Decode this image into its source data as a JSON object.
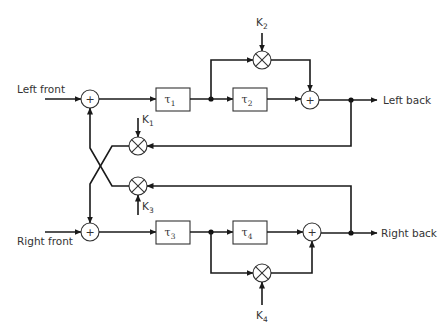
{
  "diagram": {
    "inputs": {
      "left_front": "Left front",
      "right_front": "Right front"
    },
    "outputs": {
      "left_back": "Left back",
      "right_back": "Right back"
    },
    "delays": [
      {
        "id": "tau1",
        "symbol": "τ",
        "sub": "1"
      },
      {
        "id": "tau2",
        "symbol": "τ",
        "sub": "2"
      },
      {
        "id": "tau3",
        "symbol": "τ",
        "sub": "3"
      },
      {
        "id": "tau4",
        "symbol": "τ",
        "sub": "4"
      }
    ],
    "gains": [
      {
        "id": "K1",
        "symbol": "K",
        "sub": "1"
      },
      {
        "id": "K2",
        "symbol": "K",
        "sub": "2"
      },
      {
        "id": "K3",
        "symbol": "K",
        "sub": "3"
      },
      {
        "id": "K4",
        "symbol": "K",
        "sub": "4"
      }
    ],
    "summer_symbol": "+",
    "colors": {
      "line": "#1a1a1a",
      "background": "#ffffff"
    }
  }
}
